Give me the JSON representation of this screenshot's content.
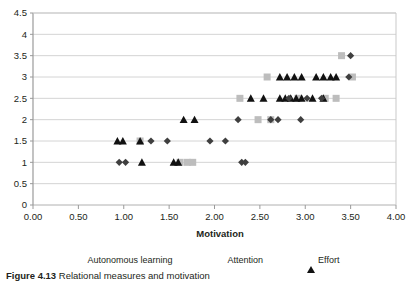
{
  "chart_data": {
    "type": "scatter",
    "title": "",
    "xlabel": "Motivation",
    "ylabel": "",
    "xlim": [
      0,
      4
    ],
    "ylim": [
      0,
      4.5
    ],
    "xticks": [
      "0.00",
      "0.50",
      "1.00",
      "1.50",
      "2.00",
      "2.50",
      "3.00",
      "3.50",
      "4.00"
    ],
    "yticks": [
      "0",
      "0.5",
      "1",
      "1.5",
      "2",
      "2.5",
      "3",
      "3.5",
      "4",
      "4.5"
    ],
    "grid": "horizontal",
    "legend_position": "bottom",
    "series": [
      {
        "name": "Autonomous learning",
        "marker": "diamond",
        "color": "#3f3f3f",
        "points": [
          [
            0.95,
            1.0
          ],
          [
            1.02,
            1.0
          ],
          [
            1.48,
            1.5
          ],
          [
            2.3,
            1.0
          ],
          [
            2.34,
            1.0
          ],
          [
            1.3,
            1.5
          ],
          [
            1.95,
            1.5
          ],
          [
            2.12,
            1.5
          ],
          [
            2.26,
            2.0
          ],
          [
            2.62,
            2.0
          ],
          [
            2.7,
            2.0
          ],
          [
            2.95,
            2.0
          ],
          [
            2.82,
            2.5
          ],
          [
            3.02,
            2.5
          ],
          [
            3.18,
            2.5
          ],
          [
            3.5,
            3.5
          ],
          [
            3.48,
            3.0
          ]
        ]
      },
      {
        "name": "Attention",
        "marker": "square",
        "color": "#bdbdbd",
        "points": [
          [
            1.18,
            1.5
          ],
          [
            1.62,
            1.0
          ],
          [
            1.7,
            1.0
          ],
          [
            1.76,
            1.0
          ],
          [
            2.28,
            2.5
          ],
          [
            2.48,
            2.0
          ],
          [
            2.62,
            2.0
          ],
          [
            2.92,
            2.5
          ],
          [
            3.22,
            2.5
          ],
          [
            3.34,
            2.5
          ],
          [
            2.58,
            3.0
          ],
          [
            3.4,
            3.5
          ],
          [
            3.52,
            3.0
          ]
        ]
      },
      {
        "name": "Effort",
        "marker": "triangle",
        "color": "#111111",
        "points": [
          [
            0.93,
            1.5
          ],
          [
            0.99,
            1.5
          ],
          [
            1.18,
            1.5
          ],
          [
            1.2,
            1.0
          ],
          [
            1.55,
            1.0
          ],
          [
            1.6,
            1.0
          ],
          [
            1.66,
            2.0
          ],
          [
            1.78,
            2.0
          ],
          [
            2.4,
            2.5
          ],
          [
            2.54,
            2.5
          ],
          [
            2.72,
            2.5
          ],
          [
            2.78,
            2.5
          ],
          [
            2.84,
            2.5
          ],
          [
            2.9,
            2.5
          ],
          [
            2.96,
            2.5
          ],
          [
            3.08,
            2.5
          ],
          [
            3.2,
            2.5
          ],
          [
            2.72,
            3.0
          ],
          [
            2.8,
            3.0
          ],
          [
            2.88,
            3.0
          ],
          [
            2.96,
            3.0
          ],
          [
            3.12,
            3.0
          ],
          [
            3.2,
            3.0
          ],
          [
            3.28,
            3.0
          ],
          [
            3.34,
            3.0
          ]
        ]
      }
    ]
  },
  "legend": {
    "items": [
      {
        "label": "Autonomous learning",
        "marker": "diamond-marker"
      },
      {
        "label": "Attention",
        "marker": "square-marker"
      },
      {
        "label": "Effort",
        "marker": "triangle-marker"
      }
    ]
  },
  "axes": {
    "x_title": "Motivation"
  },
  "caption": {
    "prefix": "Figure 4.13",
    "text": "Relational measures and motivation"
  }
}
